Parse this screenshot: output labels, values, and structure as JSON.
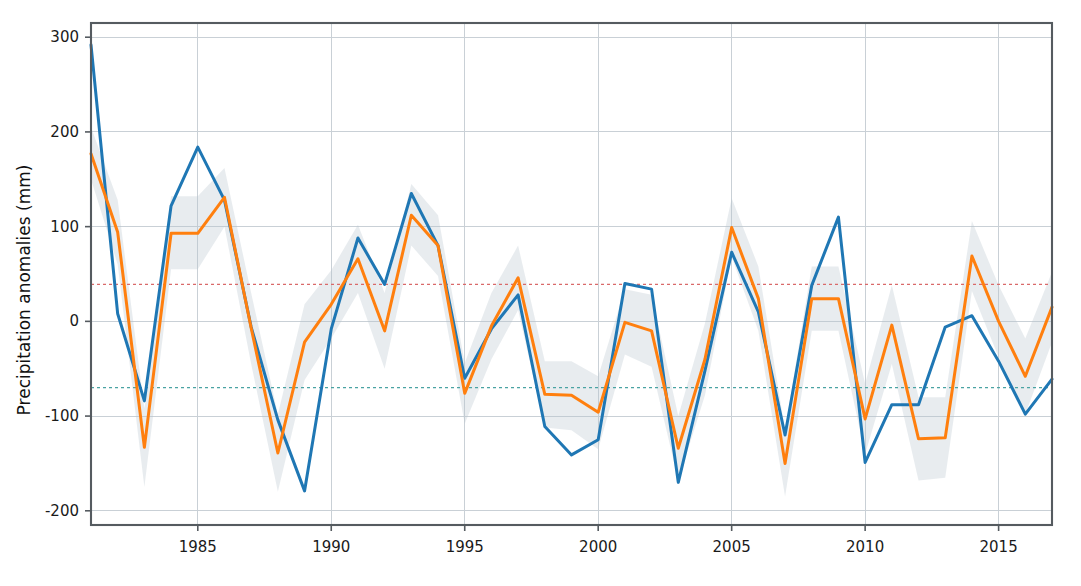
{
  "figure": {
    "background_color": "#ffffff",
    "width": 1081,
    "height": 586
  },
  "axes": {
    "y_axis_title": "Precipitation anomalies (mm)",
    "x_axis_title": "",
    "y_ticks": [
      "300",
      "200",
      "100",
      "0",
      "-100",
      "-200"
    ],
    "x_ticks": [
      "1985",
      "1990",
      "1995",
      "2000",
      "2005",
      "2010",
      "2015"
    ],
    "spine_color": "#555b60",
    "grid_color": "#c9d0d6"
  },
  "chart_data": {
    "type": "line",
    "title": "",
    "xlabel": "",
    "ylabel": "Precipitation anomalies (mm)",
    "xlim": [
      1981,
      1917
    ],
    "x_range": [
      1981,
      2017
    ],
    "ylim": [
      -215,
      315
    ],
    "y_ticks": [
      300,
      200,
      100,
      0,
      -100,
      -200
    ],
    "x_ticks": [
      1985,
      1990,
      1995,
      2000,
      2005,
      2010,
      2015
    ],
    "grid": true,
    "legend": "none",
    "x": [
      1981,
      1982,
      1983,
      1984,
      1985,
      1986,
      1987,
      1988,
      1989,
      1990,
      1991,
      1992,
      1993,
      1994,
      1995,
      1996,
      1997,
      1998,
      1999,
      2000,
      2001,
      2002,
      2003,
      2004,
      2005,
      2006,
      2007,
      2008,
      2009,
      2010,
      2011,
      2012,
      2013,
      2014,
      2015,
      2016,
      2017
    ],
    "series": [
      {
        "name": "observed",
        "color": "#1f77b4",
        "values": [
          292,
          8,
          -84,
          122,
          184,
          128,
          -6,
          -104,
          -179,
          -8,
          88,
          39,
          135,
          80,
          -60,
          -8,
          28,
          -111,
          -141,
          -125,
          40,
          34,
          -170,
          -52,
          73,
          10,
          -120,
          38,
          110,
          -149,
          -88,
          -88,
          -6,
          6,
          -42,
          -98,
          -61
        ]
      },
      {
        "name": "reconstructed",
        "color": "#ff7f0e",
        "color_hex": "#ff7f0e",
        "values": [
          177,
          94,
          -133,
          93,
          93,
          131,
          -7,
          -139,
          -22,
          18,
          66,
          -10,
          112,
          80,
          -76,
          -5,
          46,
          -77,
          -78,
          -96,
          -1,
          -10,
          -134,
          -40,
          99,
          24,
          -150,
          24,
          24,
          -103,
          -4,
          -124,
          -123,
          69,
          0,
          -58,
          15
        ]
      }
    ],
    "uncertainty_band": {
      "fill_color": "#b8c4cc",
      "opacity": 0.32,
      "description": "shaded confidence interval around reconstructed series",
      "lower": [
        150,
        60,
        -175,
        55,
        55,
        100,
        -45,
        -180,
        -62,
        -18,
        30,
        -50,
        80,
        48,
        -108,
        -40,
        12,
        -112,
        -115,
        -135,
        -35,
        -48,
        -168,
        -78,
        68,
        -10,
        -185,
        -10,
        -10,
        -140,
        -45,
        -168,
        -165,
        32,
        -38,
        -98,
        -22
      ],
      "upper": [
        205,
        128,
        -92,
        132,
        132,
        162,
        30,
        -98,
        18,
        54,
        102,
        30,
        145,
        112,
        -44,
        30,
        80,
        -42,
        -42,
        -58,
        34,
        28,
        -100,
        -2,
        130,
        58,
        -115,
        58,
        58,
        -66,
        38,
        -80,
        -80,
        106,
        38,
        -18,
        52
      ]
    },
    "reference_lines": [
      {
        "name": "upper-threshold",
        "value": 39,
        "color": "#d96a6a",
        "style": "dotted"
      },
      {
        "name": "lower-threshold",
        "value": -70,
        "color": "#4aa3a3",
        "style": "dotted"
      }
    ]
  }
}
